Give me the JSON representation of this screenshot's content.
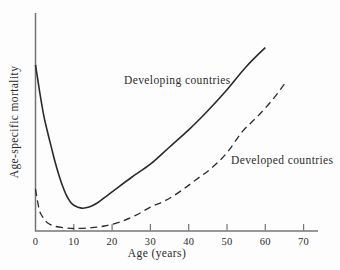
{
  "figure": {
    "x_axis_label": "Age (years)",
    "y_axis_label": "Age-specific mortality"
  },
  "chart_data": {
    "type": "line",
    "title": "",
    "xlabel": "Age (years)",
    "ylabel": "Age-specific mortality",
    "xlim": [
      0,
      74
    ],
    "x_ticks": [
      0,
      10,
      20,
      30,
      40,
      50,
      60,
      70
    ],
    "y_axis_scale": "unlabeled relative scale (values 0-100 estimated from pixel height)",
    "grid": false,
    "legend_position": "inline annotations next to curves",
    "axis_color": "#757575",
    "line_color": "#2b2b2b",
    "series": [
      {
        "id": "developing",
        "name": "Developing countries",
        "style": "solid",
        "points": [
          [
            0,
            87
          ],
          [
            1,
            74
          ],
          [
            2,
            62
          ],
          [
            3,
            53
          ],
          [
            4,
            45
          ],
          [
            5,
            37
          ],
          [
            6,
            30
          ],
          [
            7,
            24
          ],
          [
            8,
            19
          ],
          [
            9,
            15.5
          ],
          [
            10,
            13.5
          ],
          [
            12,
            12
          ],
          [
            14,
            12.5
          ],
          [
            16,
            14.5
          ],
          [
            18,
            17.5
          ],
          [
            20,
            20.5
          ],
          [
            25,
            28
          ],
          [
            30,
            35
          ],
          [
            35,
            44
          ],
          [
            40,
            53
          ],
          [
            45,
            63
          ],
          [
            50,
            74
          ],
          [
            55,
            86
          ],
          [
            60,
            96
          ]
        ]
      },
      {
        "id": "developed",
        "name": "Developed countries",
        "style": "dashed",
        "points": [
          [
            0,
            22
          ],
          [
            1,
            11
          ],
          [
            2,
            7
          ],
          [
            3,
            4.5
          ],
          [
            5,
            2.5
          ],
          [
            8,
            1.6
          ],
          [
            10,
            1.3
          ],
          [
            14,
            1.6
          ],
          [
            18,
            2.6
          ],
          [
            22,
            4.7
          ],
          [
            26,
            8
          ],
          [
            30,
            12.5
          ],
          [
            34,
            16
          ],
          [
            38,
            21
          ],
          [
            42,
            27
          ],
          [
            46,
            33
          ],
          [
            50,
            41
          ],
          [
            54,
            52
          ],
          [
            58,
            60
          ],
          [
            62,
            69
          ],
          [
            65,
            77
          ]
        ]
      }
    ]
  }
}
